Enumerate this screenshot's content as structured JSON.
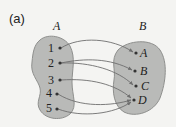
{
  "figure": {
    "panel_label": "(a)",
    "colors": {
      "background": "#f4f4f2",
      "blob_fill": "#b9bab8",
      "blob_stroke": "#8e8f8d",
      "arrow": "#6e6e6e",
      "dot": "#333333"
    },
    "set_a": {
      "name": "A",
      "elements": [
        "1",
        "2",
        "3",
        "4",
        "5"
      ]
    },
    "set_b": {
      "name": "B",
      "elements": [
        "A",
        "B",
        "C",
        "D"
      ]
    },
    "mappings": [
      {
        "from": "1",
        "to": "A"
      },
      {
        "from": "2",
        "to": "B"
      },
      {
        "from": "2",
        "to": "C"
      },
      {
        "from": "3",
        "to": "D"
      },
      {
        "from": "4",
        "to": "D"
      },
      {
        "from": "5",
        "to": "D"
      }
    ]
  }
}
